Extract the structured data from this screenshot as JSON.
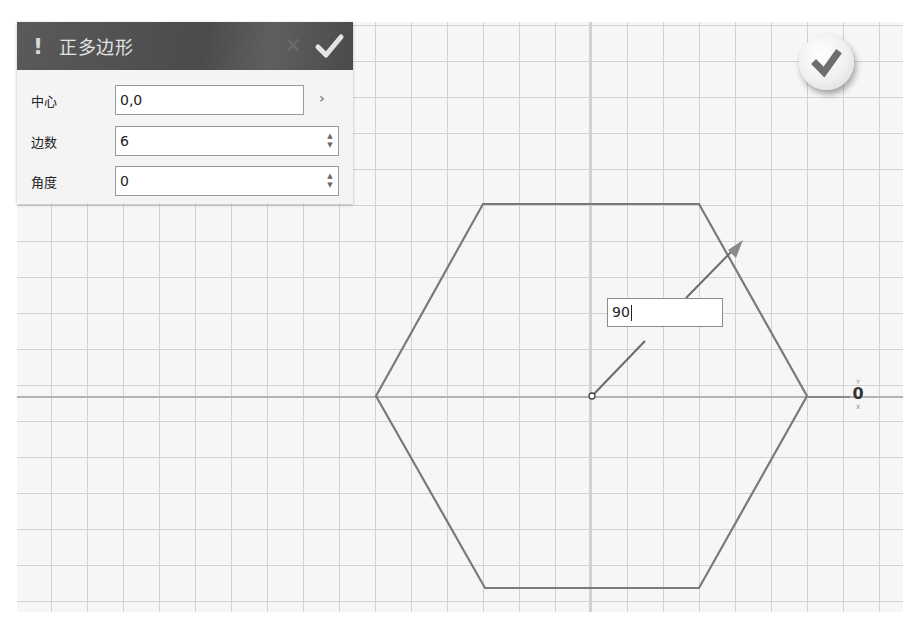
{
  "panel": {
    "title": "正多边形",
    "warning_icon": "!",
    "cancel_icon": "✕",
    "ok_icon": "check-icon",
    "fields": [
      {
        "label": "中心",
        "value": "0,0",
        "control": "expand",
        "control_glyph": "›"
      },
      {
        "label": "边数",
        "value": "6",
        "control": "spinner",
        "up": "▲",
        "down": "▼"
      },
      {
        "label": "角度",
        "value": "0",
        "control": "spinner",
        "up": "▲",
        "down": "▼"
      }
    ]
  },
  "canvas": {
    "shape": "hexagon",
    "sides": 6,
    "center": [
      592,
      396
    ],
    "vertices": [
      [
        376,
        396
      ],
      [
        483,
        204
      ],
      [
        699,
        204
      ],
      [
        807,
        396
      ],
      [
        699,
        588
      ],
      [
        485,
        588
      ]
    ],
    "stroke_color": "#7a7a7a",
    "axis_color": "#b4b4b4",
    "grid_color": "#d2d2d2",
    "direction_arrow": {
      "from": [
        592,
        396
      ],
      "to": [
        743,
        241
      ]
    }
  },
  "value_input": {
    "value": "90"
  },
  "origin_marker": {
    "top_label": "Y",
    "glyph": "0",
    "bottom_label": "X"
  },
  "ok_fab": {
    "icon": "check-icon"
  }
}
